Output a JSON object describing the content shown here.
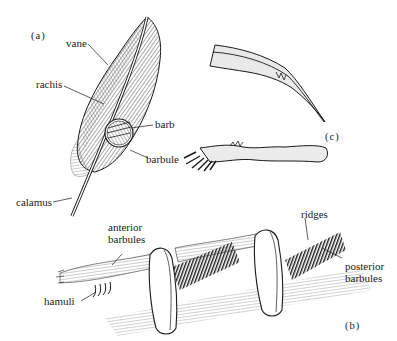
{
  "figure": {
    "panels": {
      "a": "(a)",
      "b": "(b)",
      "c": "(c)"
    },
    "labels": {
      "vane": "vane",
      "rachis": "rachis",
      "barb": "barb",
      "barbule": "barbule",
      "calamus": "calamus",
      "anterior_barbules_line1": "anterior",
      "anterior_barbules_line2": "barbules",
      "hamuli": "hamuli",
      "ridges": "ridges",
      "posterior_barbules_line1": "posterior",
      "posterior_barbules_line2": "barbules"
    },
    "colors": {
      "ink": "#1a1a1a",
      "background": "#ffffff",
      "shade": "#6a6a6a"
    }
  }
}
